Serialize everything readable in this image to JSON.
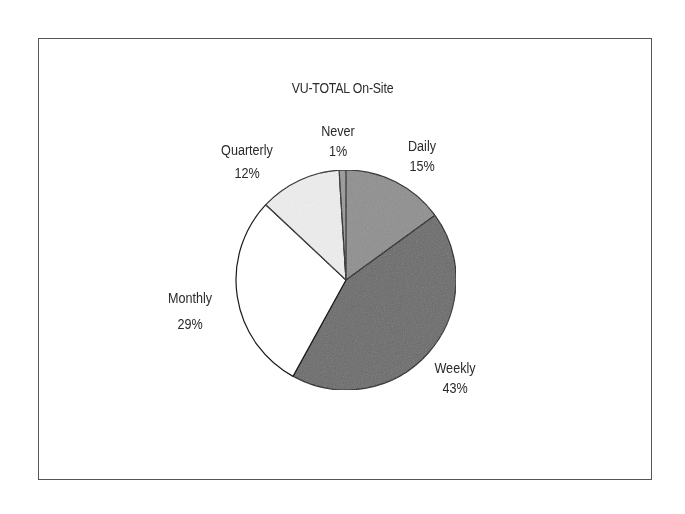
{
  "chart_data": {
    "type": "pie",
    "title": "VU-TOTAL On-Site",
    "categories": [
      "Daily",
      "Weekly",
      "Monthly",
      "Quarterly",
      "Never"
    ],
    "values": [
      15,
      43,
      29,
      12,
      1
    ],
    "value_labels": [
      "15%",
      "43%",
      "29%",
      "12%",
      "1%"
    ],
    "units": "%",
    "start_angle": "12 o'clock",
    "direction": "clockwise",
    "colors": [
      "#8f8f8f",
      "#6b6b6b",
      "#ffffff",
      "#eeeeee",
      "#9a9a9a"
    ],
    "legend": "none (direct labels)"
  },
  "slices": [
    {
      "name": "Daily",
      "pct": "15%",
      "color": "#8f8f8f"
    },
    {
      "name": "Weekly",
      "pct": "43%",
      "color": "#6b6b6b"
    },
    {
      "name": "Monthly",
      "pct": "29%",
      "color": "#ffffff"
    },
    {
      "name": "Quarterly",
      "pct": "12%",
      "color": "#eeeeee"
    },
    {
      "name": "Never",
      "pct": "1%",
      "color": "#9a9a9a"
    }
  ]
}
